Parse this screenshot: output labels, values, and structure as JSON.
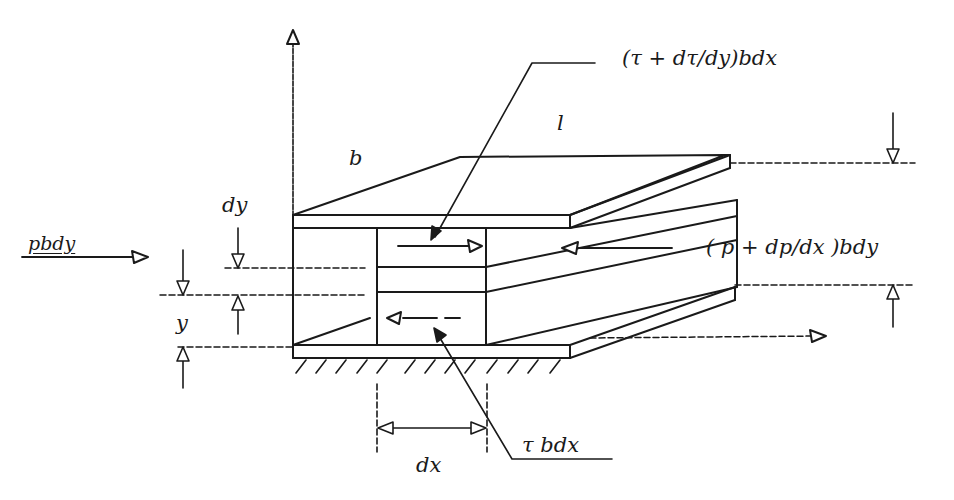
{
  "figure": {
    "type": "free-body diagram of fluid element between parallel plates",
    "ink_color": "#1a1a1a",
    "background": "#ffffff"
  },
  "labels": {
    "shear_top": "(τ + dτ/dy)bdx",
    "shear_bottom": "τ bdx",
    "pressure_left": "pbdy",
    "pressure_right": "( p + dp/dx )bdy",
    "width": "b",
    "length": "l",
    "element_height": "dy",
    "element_position": "y",
    "element_length": "dx"
  },
  "arrows": {
    "vertical_axis": "y-axis-arrow",
    "horizontal_axis": "x-axis-arrow",
    "shear_top_direction": "right",
    "shear_bottom_direction": "left",
    "pressure_left_direction": "right",
    "pressure_right_direction": "left"
  }
}
